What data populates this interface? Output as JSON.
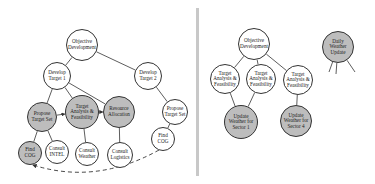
{
  "colors": {
    "node_fill_white": "#ffffff",
    "node_fill_gray": "#bdbdbd",
    "edge": "#333333",
    "divider": "#c8c8c8"
  },
  "left_panel": {
    "nodes": [
      {
        "id": "objective",
        "label": "Objective Development",
        "x": 82,
        "y": 45,
        "r": 16,
        "fill": "white"
      },
      {
        "id": "dt1",
        "label": "Develop Target 1",
        "x": 57,
        "y": 76,
        "r": 14,
        "fill": "white"
      },
      {
        "id": "dt2",
        "label": "Develop Target 2",
        "x": 148,
        "y": 76,
        "r": 14,
        "fill": "white"
      },
      {
        "id": "pts1",
        "label": "Propose Target Set",
        "x": 42,
        "y": 117,
        "r": 15,
        "fill": "gray"
      },
      {
        "id": "taf",
        "label": "Target Analysis & Feasibility",
        "x": 82,
        "y": 112,
        "r": 17,
        "fill": "gray"
      },
      {
        "id": "ra",
        "label": "Resource Allocation",
        "x": 119,
        "y": 112,
        "r": 16,
        "fill": "gray"
      },
      {
        "id": "pts2",
        "label": "Propose Target Set",
        "x": 175,
        "y": 112,
        "r": 13,
        "fill": "white"
      },
      {
        "id": "cog1",
        "label": "Find COG",
        "x": 30,
        "y": 153,
        "r": 12,
        "fill": "gray"
      },
      {
        "id": "intel",
        "label": "Consult INTEL",
        "x": 57,
        "y": 152,
        "r": 12,
        "fill": "white"
      },
      {
        "id": "weather",
        "label": "Consult Weather",
        "x": 87,
        "y": 154,
        "r": 12,
        "fill": "white"
      },
      {
        "id": "logistics",
        "label": "Consult Logistics",
        "x": 120,
        "y": 155,
        "r": 13,
        "fill": "white"
      },
      {
        "id": "cog2",
        "label": "Find COG",
        "x": 163,
        "y": 139,
        "r": 12,
        "fill": "white"
      }
    ],
    "edges": [
      [
        "objective",
        "dt1"
      ],
      [
        "objective",
        "dt2"
      ],
      [
        "dt1",
        "pts1"
      ],
      [
        "dt1",
        "taf"
      ],
      [
        "dt1",
        "ra"
      ],
      [
        "dt2",
        "pts2"
      ],
      [
        "pts2",
        "cog2"
      ],
      [
        "pts1",
        "cog1"
      ],
      [
        "pts1",
        "intel"
      ],
      [
        "taf",
        "weather"
      ],
      [
        "ra",
        "logistics"
      ]
    ],
    "sequence_arrows": [
      [
        "pts1",
        "taf"
      ],
      [
        "taf",
        "ra"
      ]
    ],
    "dashed_arrow": {
      "from": "cog2",
      "to": "cog1"
    }
  },
  "right_panel": {
    "nodes": [
      {
        "id": "objective",
        "label": "Objective Development",
        "x": 254,
        "y": 44,
        "r": 16,
        "fill": "white"
      },
      {
        "id": "dwu",
        "label": "Daily Weather Update",
        "x": 338,
        "y": 47,
        "r": 16,
        "fill": "gray"
      },
      {
        "id": "taf1",
        "label": "Target Analysis & Feasibility",
        "x": 225,
        "y": 79,
        "r": 15,
        "fill": "white"
      },
      {
        "id": "taf2",
        "label": "Target Analysis & Feasibility",
        "x": 261,
        "y": 79,
        "r": 15,
        "fill": "white"
      },
      {
        "id": "taf3",
        "label": "Target Analysis & Feasibility",
        "x": 298,
        "y": 80,
        "r": 15,
        "fill": "white"
      },
      {
        "id": "uw1",
        "label": "Update Weather for Sector 1",
        "x": 241,
        "y": 122,
        "r": 17,
        "fill": "gray"
      },
      {
        "id": "uw4",
        "label": "Update Weather for Sector 4",
        "x": 296,
        "y": 121,
        "r": 16,
        "fill": "gray"
      }
    ],
    "edges": [
      [
        "objective",
        "taf1"
      ],
      [
        "objective",
        "taf2"
      ],
      [
        "objective",
        "taf3"
      ],
      [
        "taf1",
        "uw1"
      ],
      [
        "taf2",
        "uw1"
      ],
      [
        "taf3",
        "uw4"
      ]
    ],
    "stub_lines": [
      {
        "from": "dwu",
        "to_x": 329,
        "to_y": 72
      },
      {
        "from": "dwu",
        "to_x": 336,
        "to_y": 74
      },
      {
        "from": "dwu",
        "to_x": 355,
        "to_y": 72
      }
    ]
  }
}
